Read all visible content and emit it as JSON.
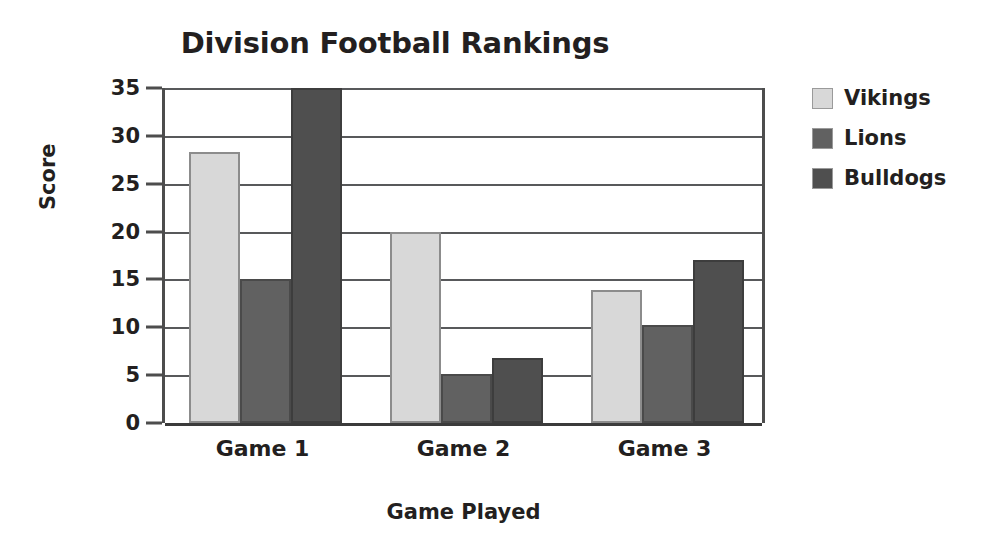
{
  "chart_data": {
    "type": "bar",
    "title": "Division Football Rankings",
    "xlabel": "Game Played",
    "ylabel": "Score",
    "categories": [
      "Game 1",
      "Game 2",
      "Game 3"
    ],
    "series": [
      {
        "name": "Vikings",
        "color": "#d8d8d8",
        "values": [
          28.3,
          20.0,
          13.9
        ]
      },
      {
        "name": "Lions",
        "color": "#616161",
        "values": [
          15.0,
          5.1,
          10.2
        ]
      },
      {
        "name": "Bulldogs",
        "color": "#4f4f4f",
        "values": [
          35.0,
          6.8,
          17.0
        ]
      }
    ],
    "ylim": [
      0,
      35
    ],
    "ytick_step": 5,
    "yticks": [
      "0",
      "5",
      "10",
      "15",
      "20",
      "25",
      "30",
      "35"
    ],
    "grid": true,
    "legend_position": "right"
  }
}
